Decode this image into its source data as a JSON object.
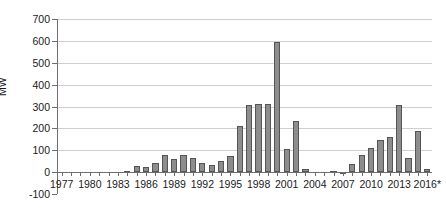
{
  "chart_data": {
    "type": "bar",
    "title": "",
    "subtitle": "",
    "xlabel": "",
    "ylabel": "MW",
    "ylim": [
      -100,
      700
    ],
    "ytick_step": 100,
    "yticks": [
      -100,
      0,
      100,
      200,
      300,
      400,
      500,
      600,
      700
    ],
    "ytick_labels": [
      "-100",
      "0",
      "100",
      "200",
      "300",
      "400",
      "500",
      "600",
      "700"
    ],
    "grid": "horizontal",
    "legend": "none",
    "bar_color": "#8d8d8d",
    "bar_border_color": "#555555",
    "axis_color": "#6e6e6e",
    "gridline_color": "#cfcfcf",
    "xtick_label_interval": 3,
    "xtick_labels": [
      "1977",
      "1980",
      "1983",
      "1986",
      "1989",
      "1992",
      "1995",
      "1998",
      "2001",
      "2004",
      "2007",
      "2010",
      "2013",
      "2016*"
    ],
    "footnote_marker": "*",
    "categories": [
      "1977",
      "1978",
      "1979",
      "1980",
      "1981",
      "1982",
      "1983",
      "1984",
      "1985",
      "1986",
      "1987",
      "1988",
      "1989",
      "1990",
      "1991",
      "1992",
      "1993",
      "1994",
      "1995",
      "1996",
      "1997",
      "1998",
      "1999",
      "2000",
      "2001",
      "2002",
      "2003",
      "2004",
      "2005",
      "2006",
      "2007",
      "2008",
      "2009",
      "2010",
      "2011",
      "2012",
      "2013",
      "2014",
      "2015",
      "2016*"
    ],
    "values": [
      0,
      0,
      0,
      0,
      0,
      0,
      0,
      4,
      28,
      23,
      40,
      79,
      58,
      77,
      64,
      43,
      31,
      53,
      72,
      213,
      306,
      311,
      312,
      594,
      104,
      232,
      13,
      0,
      0,
      5,
      -3,
      39,
      79,
      112,
      148,
      160,
      305,
      66,
      189,
      13
    ]
  }
}
